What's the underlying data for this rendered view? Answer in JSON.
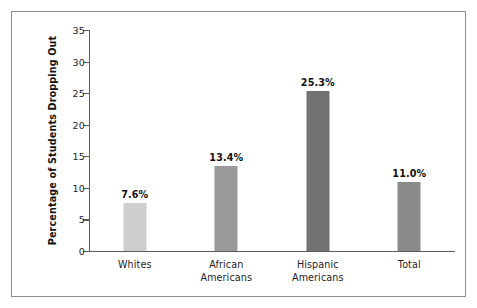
{
  "figure": {
    "frame_border_color": "#8d8d91",
    "background": "#ffffff"
  },
  "chart_data": {
    "type": "bar",
    "title": "",
    "xlabel": "",
    "ylabel": "Percentage of Students Dropping Out",
    "categories": [
      "Whites",
      "African\nAmericans",
      "Hispanic\nAmericans",
      "Total"
    ],
    "values": [
      7.6,
      13.4,
      25.3,
      11.0
    ],
    "value_labels": [
      "7.6%",
      "13.4%",
      "25.3%",
      "11.0%"
    ],
    "bar_colors": [
      "#cfcfcf",
      "#9a9a9a",
      "#727272",
      "#8a8a8a"
    ],
    "ylim": [
      0,
      35
    ],
    "ytick_values": [
      0,
      5,
      10,
      15,
      20,
      25,
      30,
      35
    ],
    "ytick_labels": [
      "0",
      "5",
      "10",
      "15",
      "20",
      "25",
      "30",
      "35"
    ],
    "grid": false,
    "legend": null,
    "axis_color": "#5c5c60"
  }
}
